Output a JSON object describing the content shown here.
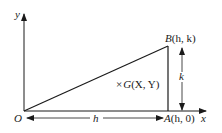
{
  "diagram": {
    "axes": {
      "x_label": "x",
      "y_label": "y",
      "origin_label": "O"
    },
    "points": {
      "B": {
        "label_letter": "B",
        "label_coords": "(h, k)"
      },
      "A": {
        "label_letter": "A",
        "label_coords": "(h, 0)"
      },
      "G": {
        "marker": "×",
        "label_letter": "G",
        "label_coords": "(X, Y)"
      }
    },
    "dimensions": {
      "horizontal": "h",
      "vertical": "k"
    },
    "colors": {
      "line": "#1a1a1a",
      "background": "#ffffff"
    }
  }
}
